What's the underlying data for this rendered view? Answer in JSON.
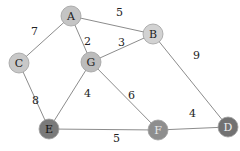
{
  "chart_data": {
    "type": "graph",
    "directed": false,
    "weighted": true,
    "nodes": [
      {
        "id": "A",
        "x": 71,
        "y": 16,
        "fill": "#c4c4c4",
        "text_color": "#222222"
      },
      {
        "id": "B",
        "x": 153,
        "y": 34,
        "fill": "#d2d2d2",
        "text_color": "#222222"
      },
      {
        "id": "C",
        "x": 19,
        "y": 63,
        "fill": "#c8c8c8",
        "text_color": "#222222"
      },
      {
        "id": "G",
        "x": 91,
        "y": 62,
        "fill": "#bcbcbc",
        "text_color": "#222222"
      },
      {
        "id": "E",
        "x": 49,
        "y": 129,
        "fill": "#7a7a7a",
        "text_color": "#111111"
      },
      {
        "id": "F",
        "x": 158,
        "y": 130,
        "fill": "#8e8e8e",
        "text_color": "#e8e8e8"
      },
      {
        "id": "D",
        "x": 228,
        "y": 127,
        "fill": "#727272",
        "text_color": "#f0f0f0"
      }
    ],
    "edges": [
      {
        "from": "A",
        "to": "B",
        "weight": "5",
        "lx": 116,
        "ly": 16
      },
      {
        "from": "A",
        "to": "C",
        "weight": "7",
        "lx": 31,
        "ly": 35
      },
      {
        "from": "A",
        "to": "G",
        "weight": "2",
        "lx": 84,
        "ly": 45
      },
      {
        "from": "G",
        "to": "B",
        "weight": "3",
        "lx": 118,
        "ly": 46
      },
      {
        "from": "B",
        "to": "D",
        "weight": "9",
        "lx": 193,
        "ly": 59
      },
      {
        "from": "C",
        "to": "E",
        "weight": "8",
        "lx": 32,
        "ly": 104
      },
      {
        "from": "G",
        "to": "E",
        "weight": "4",
        "lx": 84,
        "ly": 97
      },
      {
        "from": "G",
        "to": "F",
        "weight": "6",
        "lx": 128,
        "ly": 99
      },
      {
        "from": "E",
        "to": "F",
        "weight": "5",
        "lx": 113,
        "ly": 142
      },
      {
        "from": "F",
        "to": "D",
        "weight": "4",
        "lx": 189,
        "ly": 117
      }
    ],
    "node_radius": 10,
    "edge_color": "#8c8c8c"
  }
}
